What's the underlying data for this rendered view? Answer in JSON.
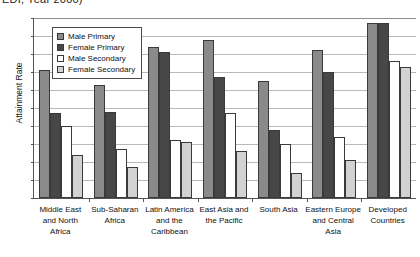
{
  "chart_data": {
    "type": "bar",
    "title": "EDI, Year 2000)",
    "xlabel": "",
    "ylabel": "Attainment Rate",
    "ylim": [
      0,
      100
    ],
    "ytick_step": 10,
    "yticks": [
      0,
      10,
      20,
      30,
      40,
      50,
      60,
      70,
      80,
      90,
      100
    ],
    "grid": true,
    "legend_position": "inside-top-left",
    "categories": [
      "Middle East and North Africa",
      "Sub-Saharan Africa",
      "Latin America and the Caribbean",
      "East Asia and the Pacific",
      "South Asia",
      "Eastern Europe and Central Asia",
      "Developed Countries"
    ],
    "category_lines": [
      [
        "Middle East",
        "and North",
        "Africa"
      ],
      [
        "Sub-Saharan",
        "Africa"
      ],
      [
        "Latin America",
        "and the",
        "Caribbean"
      ],
      [
        "East Asia and",
        "the Pacific"
      ],
      [
        "South Asia"
      ],
      [
        "Eastern Europe",
        "and Central",
        "Asia"
      ],
      [
        "Developed",
        "Countries"
      ]
    ],
    "series": [
      {
        "name": "Male Primary",
        "color": "#8a8a8a",
        "values": [
          71,
          63,
          84,
          88,
          65,
          82,
          97
        ]
      },
      {
        "name": "Female Primary",
        "color": "#474747",
        "values": [
          47,
          48,
          81,
          67,
          38,
          70,
          97
        ]
      },
      {
        "name": "Male Secondary",
        "color": "#ffffff",
        "values": [
          40,
          27,
          32,
          47,
          30,
          34,
          76
        ]
      },
      {
        "name": "Female Secondary",
        "color": "#d2d2d2",
        "values": [
          24,
          17,
          31,
          26,
          14,
          21,
          73
        ]
      }
    ]
  },
  "legend": {
    "items": [
      {
        "label": "Male Primary"
      },
      {
        "label": "Female Primary"
      },
      {
        "label": "Male Secondary"
      },
      {
        "label": "Female Secondary"
      }
    ]
  }
}
